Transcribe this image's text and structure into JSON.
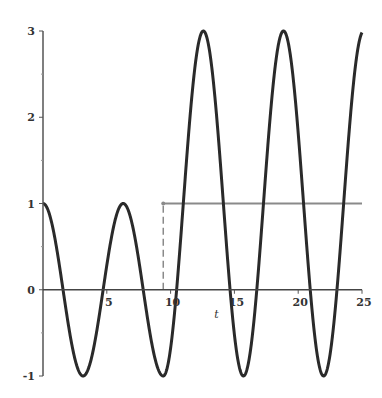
{
  "chart_data": {
    "type": "line",
    "title": "",
    "xlabel": "t",
    "ylabel": "",
    "xlim": [
      0,
      25
    ],
    "ylim": [
      -1,
      3
    ],
    "x_ticks": [
      5,
      10,
      15,
      20,
      25
    ],
    "y_ticks": [
      -1,
      0,
      1,
      2,
      3
    ],
    "grid": false,
    "legend": null,
    "series": [
      {
        "name": "response",
        "description": "y = cos(t) for t < 3π; y = 1 + 2cos(t) for t ≥ 3π",
        "color": "#2a2a2a",
        "x": [
          0,
          3.14,
          4.71,
          6.28,
          9.42,
          12.57,
          15.71,
          18.85,
          21.99,
          25
        ],
        "values": [
          1,
          -1,
          0,
          1,
          -1,
          3,
          -1,
          3,
          -1,
          2.98
        ]
      },
      {
        "name": "step",
        "description": "unit step starting at t = 3π (dashed vertical jump)",
        "color": "#8a8a8a",
        "x": [
          9.42,
          25
        ],
        "values": [
          1,
          1
        ]
      }
    ]
  },
  "axes": {
    "x_label": "t",
    "x_tick_labels": [
      "5",
      "10",
      "15",
      "20",
      "25"
    ],
    "y_tick_labels": [
      "-1",
      "0",
      "1",
      "2",
      "3"
    ]
  }
}
